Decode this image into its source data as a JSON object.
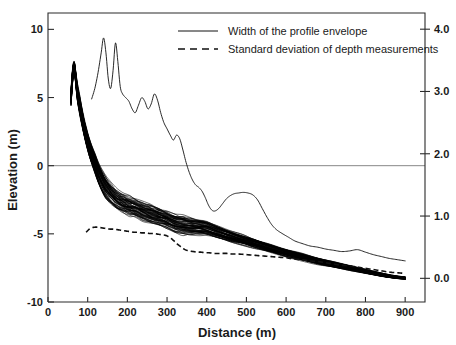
{
  "figure": {
    "background": "#ffffff",
    "ink_color": "#111111"
  },
  "chart_data": {
    "type": "line",
    "title": "",
    "xlabel": "Distance (m)",
    "ylabel": "Elevation (m)",
    "y2label": "",
    "xlim": [
      0,
      950
    ],
    "ylim": [
      -10,
      11.2
    ],
    "y2lim": [
      -0.38,
      4.26
    ],
    "grid": false,
    "legend_position": "top-center",
    "xticks": [
      0,
      100,
      200,
      300,
      400,
      500,
      600,
      700,
      800,
      900
    ],
    "xtick_labels": [
      "0",
      "100",
      "200",
      "300",
      "400",
      "500",
      "600",
      "700",
      "800",
      "900"
    ],
    "yticks": [
      10,
      5,
      0,
      -5,
      -10
    ],
    "ytick_labels": [
      "10",
      "5",
      "0",
      "-5",
      "-10"
    ],
    "y2ticks": [
      4.0,
      3.0,
      2.0,
      1.0,
      0.0
    ],
    "y2tick_labels": [
      "4.0",
      "3.0",
      "2.0",
      "1.0",
      "0.0"
    ],
    "zero_reference_line": 0,
    "series": [
      {
        "name": "Width of the profile envelope",
        "style": "solid",
        "axis": "right",
        "x": [
          110,
          118,
          126,
          134,
          140,
          146,
          152,
          158,
          164,
          170,
          176,
          182,
          188,
          196,
          204,
          212,
          220,
          228,
          236,
          244,
          252,
          260,
          268,
          276,
          284,
          292,
          300,
          308,
          316,
          324,
          332,
          340,
          348,
          356,
          364,
          372,
          380,
          388,
          396,
          404,
          412,
          420,
          430,
          440,
          450,
          460,
          470,
          480,
          492,
          504,
          516,
          528,
          540,
          552,
          564,
          576,
          590,
          606,
          622,
          640,
          660,
          680,
          700,
          720,
          740,
          760,
          780,
          800,
          820,
          840,
          860,
          880,
          900
        ],
        "y": [
          2.88,
          3.05,
          3.3,
          3.62,
          3.86,
          3.62,
          3.2,
          3.05,
          3.34,
          3.78,
          3.48,
          3.08,
          2.96,
          2.9,
          2.84,
          2.72,
          2.66,
          2.78,
          2.9,
          2.84,
          2.72,
          2.8,
          2.96,
          2.86,
          2.66,
          2.5,
          2.4,
          2.3,
          2.22,
          2.3,
          2.24,
          2.06,
          1.86,
          1.7,
          1.58,
          1.5,
          1.46,
          1.4,
          1.3,
          1.18,
          1.1,
          1.08,
          1.12,
          1.2,
          1.28,
          1.33,
          1.36,
          1.37,
          1.38,
          1.37,
          1.34,
          1.26,
          1.12,
          0.98,
          0.86,
          0.78,
          0.72,
          0.66,
          0.6,
          0.56,
          0.52,
          0.5,
          0.47,
          0.45,
          0.43,
          0.44,
          0.46,
          0.42,
          0.38,
          0.35,
          0.32,
          0.3,
          0.28
        ]
      },
      {
        "name": "Standard deviation of depth measurements",
        "style": "dashed",
        "axis": "right",
        "x": [
          96,
          106,
          116,
          126,
          136,
          146,
          156,
          166,
          176,
          186,
          196,
          206,
          216,
          226,
          236,
          246,
          256,
          266,
          276,
          286,
          296,
          306,
          316,
          326,
          336,
          346,
          356,
          366,
          376,
          386,
          396,
          406,
          420,
          435,
          450,
          465,
          480,
          500,
          520,
          540,
          560,
          580,
          600,
          620,
          640,
          660,
          680,
          700,
          720,
          740,
          760,
          780,
          800,
          820,
          840,
          860,
          880,
          900
        ],
        "y": [
          0.74,
          0.8,
          0.82,
          0.82,
          0.81,
          0.8,
          0.79,
          0.79,
          0.78,
          0.77,
          0.76,
          0.75,
          0.74,
          0.74,
          0.73,
          0.73,
          0.72,
          0.72,
          0.71,
          0.7,
          0.69,
          0.66,
          0.61,
          0.55,
          0.5,
          0.46,
          0.44,
          0.43,
          0.42,
          0.42,
          0.41,
          0.41,
          0.4,
          0.4,
          0.4,
          0.39,
          0.39,
          0.38,
          0.37,
          0.36,
          0.35,
          0.34,
          0.33,
          0.31,
          0.3,
          0.28,
          0.27,
          0.25,
          0.23,
          0.21,
          0.2,
          0.18,
          0.16,
          0.14,
          0.12,
          0.1,
          0.09,
          0.08
        ]
      }
    ],
    "profile_bundle": {
      "name": "Beach profile envelope (many surveys)",
      "axis": "left",
      "style": "solid",
      "count": 60,
      "x": [
        58,
        62,
        66,
        70,
        74,
        80,
        88,
        96,
        106,
        118,
        130,
        145,
        160,
        175,
        190,
        205,
        220,
        240,
        260,
        280,
        300,
        320,
        340,
        360,
        380,
        400,
        430,
        460,
        490,
        520,
        560,
        600,
        640,
        680,
        720,
        760,
        800,
        840,
        870,
        900
      ],
      "mean_y": [
        5.0,
        6.6,
        7.3,
        6.4,
        5.4,
        4.4,
        3.2,
        2.2,
        1.2,
        0.2,
        -0.7,
        -1.55,
        -2.1,
        -2.5,
        -2.75,
        -2.95,
        -3.1,
        -3.35,
        -3.55,
        -3.75,
        -3.95,
        -4.2,
        -4.35,
        -4.45,
        -4.5,
        -4.6,
        -4.9,
        -5.2,
        -5.45,
        -5.7,
        -6.05,
        -6.4,
        -6.7,
        -7.0,
        -7.25,
        -7.5,
        -7.75,
        -8.0,
        -8.15,
        -8.25
      ],
      "spread_y": [
        0.55,
        0.45,
        0.3,
        0.45,
        0.55,
        0.6,
        0.62,
        0.62,
        0.62,
        0.66,
        0.72,
        0.72,
        0.66,
        0.62,
        0.6,
        0.6,
        0.62,
        0.62,
        0.6,
        0.58,
        0.56,
        0.58,
        0.6,
        0.55,
        0.5,
        0.45,
        0.4,
        0.36,
        0.32,
        0.3,
        0.26,
        0.24,
        0.22,
        0.2,
        0.18,
        0.16,
        0.14,
        0.12,
        0.1,
        0.08
      ]
    }
  },
  "legend": {
    "items": [
      {
        "label": "Width of the profile envelope",
        "style": "solid"
      },
      {
        "label": "Standard deviation of depth measurements",
        "style": "dashed"
      }
    ]
  }
}
